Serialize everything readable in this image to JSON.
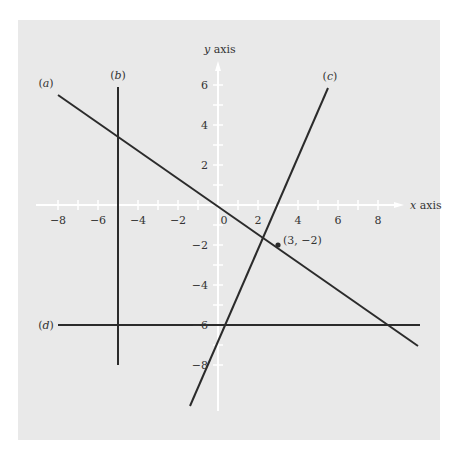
{
  "chart_data": {
    "type": "line",
    "title": "",
    "xlabel": "x axis",
    "ylabel": "y axis",
    "xlim": [
      -9,
      9.5
    ],
    "ylim": [
      -10,
      7
    ],
    "grid": false,
    "x_ticks": [
      -8,
      -6,
      -4,
      -2,
      0,
      2,
      4,
      6,
      8
    ],
    "y_ticks": [
      -8,
      -6,
      -4,
      -2,
      2,
      4,
      6
    ],
    "x_tick_labels": [
      "−8",
      "−6",
      "−4",
      "−2",
      "0",
      "2",
      "4",
      "6",
      "8"
    ],
    "y_tick_labels": [
      "−8",
      "−6",
      "−4",
      "−2",
      "2",
      "4",
      "6"
    ],
    "series": [
      {
        "name": "(a)",
        "points": [
          [
            -8,
            5.5
          ],
          [
            10,
            -7.05
          ]
        ]
      },
      {
        "name": "(b)",
        "points": [
          [
            -5,
            5.9
          ],
          [
            -5,
            -8
          ]
        ]
      },
      {
        "name": "(c)",
        "points": [
          [
            -1.4,
            -10.05
          ],
          [
            5.5,
            5.85
          ]
        ]
      },
      {
        "name": "(d)",
        "points": [
          [
            -8,
            -6
          ],
          [
            10.1,
            -6
          ]
        ]
      }
    ],
    "annotations": [
      {
        "text": "(3, −2)",
        "point": [
          3,
          -2
        ]
      }
    ]
  },
  "colors": {
    "background": "#e9e9e9",
    "axis": "#ffffff",
    "line": "#2b2b2b",
    "text": "#333333"
  }
}
